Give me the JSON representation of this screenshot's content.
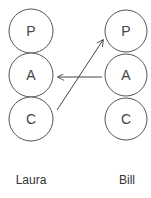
{
  "diagram": {
    "type": "transactional-analysis",
    "people": [
      {
        "name": "Laura",
        "states": [
          {
            "label": "P"
          },
          {
            "label": "A"
          },
          {
            "label": "C"
          }
        ]
      },
      {
        "name": "Bill",
        "states": [
          {
            "label": "P"
          },
          {
            "label": "A"
          },
          {
            "label": "C"
          }
        ]
      }
    ],
    "transactions": [
      {
        "from": "Bill.A",
        "to": "Laura.A"
      },
      {
        "from": "Laura.C",
        "to": "Bill.P"
      }
    ],
    "colors": {
      "stroke": "#555555",
      "text": "#444444",
      "background": "#ffffff"
    }
  }
}
